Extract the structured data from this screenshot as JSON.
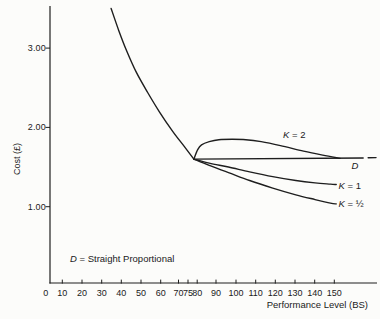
{
  "chart_data": {
    "type": "line",
    "title": "",
    "xlabel": "Performance Level (BS)",
    "ylabel": "Cost (£)",
    "grid": false,
    "xlim": [
      0,
      172
    ],
    "ylim": [
      0,
      3.55
    ],
    "x_tick_values": [
      0,
      10,
      20,
      30,
      40,
      50,
      60,
      70,
      75,
      80,
      90,
      100,
      110,
      120,
      130,
      140,
      150
    ],
    "x_tick_labels": [
      "0",
      "10",
      "20",
      "30",
      "40",
      "50",
      "60",
      "70",
      "75",
      "80",
      "90",
      "100",
      "110",
      "120",
      "130",
      "140",
      "150"
    ],
    "y_tick_values": [
      3.0,
      2.0,
      1.0
    ],
    "y_tick_labels": [
      "3.00",
      "2.00",
      "1.00"
    ],
    "annotation": {
      "sym": "D",
      "rest": " = Straight Proportional"
    },
    "curve_labels": {
      "k2": {
        "sym": "K",
        "rest": " = 2"
      },
      "d": {
        "sym": "D",
        "rest": ""
      },
      "k1": {
        "sym": "K",
        "rest": " = 1"
      },
      "khalf": {
        "sym": "K",
        "rest": " = ½"
      }
    },
    "series": [
      {
        "name": "total-cost-curve",
        "x": [
          34,
          38,
          42,
          47,
          53,
          59,
          66,
          72,
          77
        ],
        "y": [
          3.5,
          3.22,
          2.97,
          2.7,
          2.44,
          2.2,
          1.95,
          1.76,
          1.6
        ]
      },
      {
        "name": "K = 2",
        "x": [
          77,
          79,
          81,
          85,
          90,
          97,
          104,
          112,
          122,
          134,
          144,
          153
        ],
        "y": [
          1.6,
          1.72,
          1.78,
          1.82,
          1.845,
          1.85,
          1.845,
          1.82,
          1.77,
          1.7,
          1.65,
          1.61
        ]
      },
      {
        "name": "D straight proportional",
        "x": [
          77,
          165
        ],
        "y": [
          1.6,
          1.615
        ]
      },
      {
        "name": "D continuation dash",
        "x": [
          167.6,
          171.7
        ],
        "y": [
          1.617,
          1.619
        ]
      },
      {
        "name": "K = 1",
        "x": [
          77,
          85,
          95,
          106,
          118,
          130,
          140,
          148,
          151
        ],
        "y": [
          1.6,
          1.55,
          1.5,
          1.44,
          1.38,
          1.33,
          1.3,
          1.285,
          1.28
        ]
      },
      {
        "name": "K = ½",
        "x": [
          77,
          85,
          95,
          106,
          118,
          130,
          140,
          148,
          151
        ],
        "y": [
          1.6,
          1.52,
          1.43,
          1.33,
          1.235,
          1.15,
          1.09,
          1.045,
          1.035
        ]
      }
    ],
    "colors": {
      "line": "#1e1e1e",
      "text": "#1a1a1a",
      "background": "#fcfcfa"
    }
  }
}
